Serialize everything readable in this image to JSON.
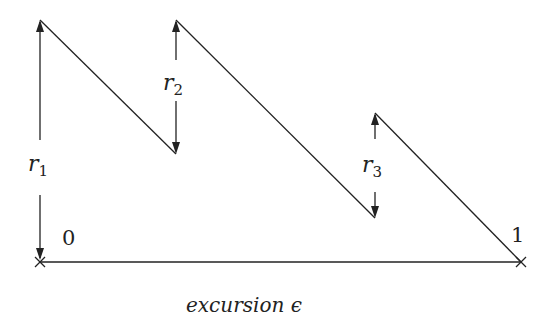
{
  "diagram": {
    "x_axis_label": "excursion ϵ",
    "endpoints": {
      "start": "0",
      "end": "1"
    },
    "rebounds": [
      {
        "name": "r",
        "sub": "1"
      },
      {
        "name": "r",
        "sub": "2"
      },
      {
        "name": "r",
        "sub": "3"
      }
    ],
    "line_color": "#222222",
    "segments": [
      {
        "from": [
          40,
          20
        ],
        "to": [
          176,
          154
        ]
      },
      {
        "from": [
          176,
          20
        ],
        "to": [
          375,
          218
        ]
      },
      {
        "from": [
          375,
          113
        ],
        "to": [
          521,
          262
        ]
      }
    ]
  }
}
